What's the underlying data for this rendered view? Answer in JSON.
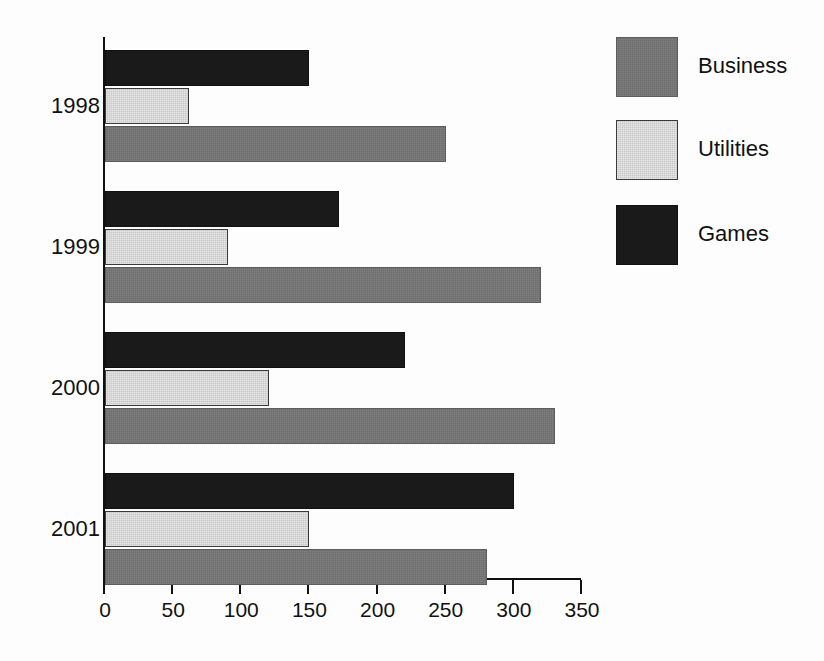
{
  "chart_data": {
    "type": "bar",
    "orientation": "horizontal",
    "title": "",
    "xlabel": "",
    "ylabel": "",
    "categories": [
      "1998",
      "1999",
      "2000",
      "2001"
    ],
    "series": [
      {
        "name": "Business",
        "color": "#6e6e6e",
        "values": [
          250,
          320,
          330,
          280
        ]
      },
      {
        "name": "Utilities",
        "color": "#c9c9c9",
        "values": [
          62,
          90,
          120,
          150
        ]
      },
      {
        "name": "Games",
        "color": "#1a1a1a",
        "values": [
          150,
          172,
          220,
          300
        ]
      }
    ],
    "series_draw_order": [
      "Games",
      "Utilities",
      "Business"
    ],
    "xlim": [
      0,
      350
    ],
    "xticks": [
      0,
      50,
      100,
      150,
      200,
      250,
      300,
      350
    ],
    "xtick_labels": [
      "0",
      "50",
      "100",
      "150",
      "200",
      "250",
      "300",
      "350"
    ],
    "grid": false,
    "legend_position": "right",
    "legend": [
      {
        "label": "Business",
        "swatch": "business-swatch",
        "color": "#6e6e6e"
      },
      {
        "label": "Utilities",
        "swatch": "utilities-swatch",
        "color": "#c9c9c9"
      },
      {
        "label": "Games",
        "swatch": "games-swatch",
        "color": "#1a1a1a"
      }
    ]
  },
  "axis": {
    "ticks": [
      {
        "value": 0,
        "label": "0"
      },
      {
        "value": 50,
        "label": "50"
      },
      {
        "value": 100,
        "label": "100"
      },
      {
        "value": 150,
        "label": "150"
      },
      {
        "value": 200,
        "label": "200"
      },
      {
        "value": 250,
        "label": "250"
      },
      {
        "value": 300,
        "label": "300"
      },
      {
        "value": 350,
        "label": "350"
      }
    ]
  },
  "groups": [
    {
      "year": "1998",
      "bars": [
        {
          "series": "Games",
          "value": 150
        },
        {
          "series": "Utilities",
          "value": 62
        },
        {
          "series": "Business",
          "value": 250
        }
      ]
    },
    {
      "year": "1999",
      "bars": [
        {
          "series": "Games",
          "value": 172
        },
        {
          "series": "Utilities",
          "value": 90
        },
        {
          "series": "Business",
          "value": 320
        }
      ]
    },
    {
      "year": "2000",
      "bars": [
        {
          "series": "Games",
          "value": 220
        },
        {
          "series": "Utilities",
          "value": 120
        },
        {
          "series": "Business",
          "value": 330
        }
      ]
    },
    {
      "year": "2001",
      "bars": [
        {
          "series": "Games",
          "value": 300
        },
        {
          "series": "Utilities",
          "value": 150
        },
        {
          "series": "Business",
          "value": 280
        }
      ]
    }
  ]
}
